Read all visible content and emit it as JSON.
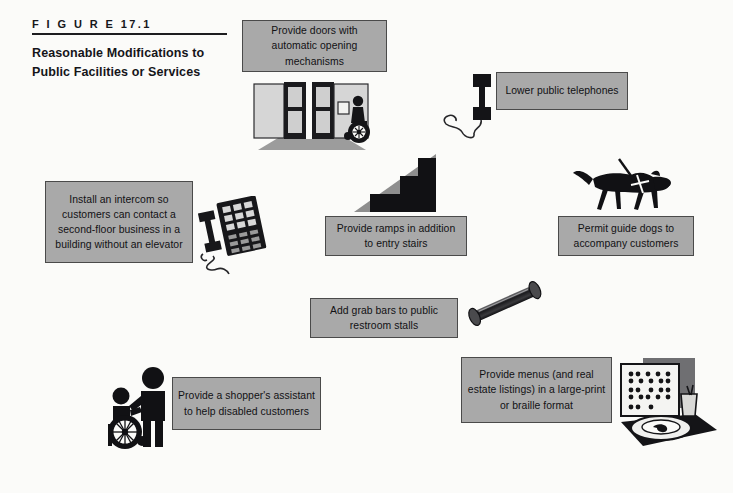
{
  "figure": {
    "number_label": "F I G U R E    17.1",
    "title": "Reasonable Modifications to Public Facilities or Services"
  },
  "colors": {
    "page_background": "#fbfbf9",
    "box_fill": "#a9a9a9",
    "box_border": "#4a4a4a",
    "ink": "#111114",
    "mid_gray": "#8e8e8e",
    "light_gray": "#c9c9c9"
  },
  "captions": [
    {
      "id": "automatic-doors",
      "text": "Provide doors with automatic opening mechanisms",
      "illustration": "automatic-doors-illustration"
    },
    {
      "id": "lower-telephones",
      "text": "Lower public telephones",
      "illustration": "public-telephone-illustration"
    },
    {
      "id": "intercom",
      "text": "Install an intercom so customers can contact a second-floor business in a building without an elevator",
      "illustration": "desk-telephone-illustration"
    },
    {
      "id": "ramps",
      "text": "Provide ramps in addition to entry stairs",
      "illustration": "ramp-stairs-illustration"
    },
    {
      "id": "guide-dogs",
      "text": "Permit guide dogs to accompany customers",
      "illustration": "guide-dog-illustration"
    },
    {
      "id": "grab-bars",
      "text": "Add grab bars to public restroom stalls",
      "illustration": "grab-bar-illustration"
    },
    {
      "id": "shoppers-assistant",
      "text": "Provide a shopper's assistant to help disabled customers",
      "illustration": "wheelchair-assistant-illustration"
    },
    {
      "id": "braille-menus",
      "text": "Provide menus (and real estate listings) in a large-print or braille format",
      "illustration": "braille-menu-illustration"
    }
  ]
}
